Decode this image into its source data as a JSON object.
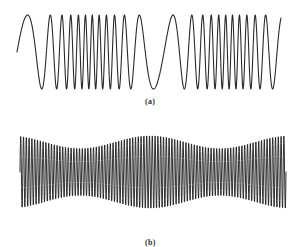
{
  "figure": {
    "panels": [
      {
        "id": "a",
        "label": "(a)",
        "kind": "frequency-modulated waveform",
        "x_range": [
          17,
          281
        ],
        "center_y": 52,
        "amplitude": 37,
        "base_cycles_per_px": 0.085,
        "deviation": 0.062,
        "modulation_periods": 1.9,
        "modulation_phase": -1.75
      },
      {
        "id": "b",
        "label": "(b)",
        "kind": "amplitude-modulated waveform",
        "x_range": [
          20,
          286
        ],
        "center_y": 172,
        "carrier_cycles": 95,
        "envelope_mean": 30.5,
        "envelope_depth": 6.5,
        "modulation_periods": 1.9,
        "modulation_phase": 0.45
      }
    ],
    "colors": {
      "stroke": "#2a2a2a",
      "background": "#ffffff",
      "label": "#333333"
    }
  }
}
